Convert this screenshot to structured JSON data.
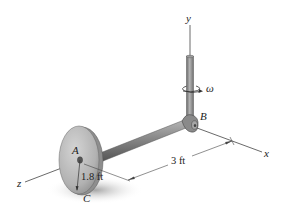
{
  "figure": {
    "labels": {
      "y_axis": "y",
      "x_axis": "x",
      "z_axis": "z",
      "omega": "ω",
      "point_A": "A",
      "point_B": "B",
      "point_C": "C"
    },
    "dimensions": {
      "rod_length": "3 ft",
      "disk_radius": "1.8 ft"
    },
    "colors": {
      "metal_dark": "#6e6e6e",
      "metal_mid": "#9a9a9a",
      "metal_light": "#c8c8c8",
      "line": "#333333",
      "shadow": "#b0b0b0"
    }
  }
}
